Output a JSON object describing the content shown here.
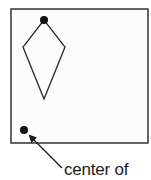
{
  "diagram": {
    "frame": {
      "x": 11,
      "y": 9,
      "width": 137,
      "height": 134,
      "stroke": "#333333"
    },
    "kite": {
      "points": [
        [
          44,
          20
        ],
        [
          23,
          47
        ],
        [
          44,
          99
        ],
        [
          65,
          47
        ]
      ],
      "stroke": "#2a2a2a"
    },
    "points": [
      {
        "name": "kite-top-vertex",
        "cx": 44,
        "cy": 20,
        "r": 4
      },
      {
        "name": "center-point",
        "cx": 24,
        "cy": 130,
        "r": 4
      }
    ],
    "arrow": {
      "x1": 62,
      "y1": 168,
      "x2": 29,
      "y2": 135
    },
    "label": "center of"
  }
}
